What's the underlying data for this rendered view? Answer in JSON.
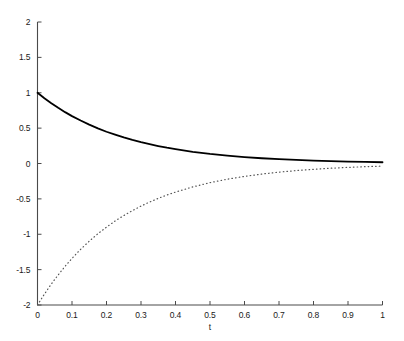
{
  "chart_data": {
    "type": "line",
    "title": "",
    "xlabel": "t",
    "ylabel": "",
    "xlim": [
      0,
      1
    ],
    "ylim": [
      -2,
      2
    ],
    "grid": false,
    "legend": "none",
    "xticks": [
      "0",
      "0.1",
      "0.2",
      "0.3",
      "0.4",
      "0.5",
      "0.6",
      "0.7",
      "0.8",
      "0.9",
      "1"
    ],
    "xtick_values": [
      0,
      0.1,
      0.2,
      0.3,
      0.4,
      0.5,
      0.6,
      0.7,
      0.8,
      0.9,
      1
    ],
    "yticks": [
      "2",
      "1.5",
      "1",
      "0.5",
      "0",
      "-0.5",
      "-1",
      "-1.5",
      "-2"
    ],
    "ytick_values": [
      2,
      1.5,
      1,
      0.5,
      0,
      -0.5,
      -1,
      -1.5,
      -2
    ],
    "series": [
      {
        "name": "solid-curve",
        "style": "solid",
        "color": "#000000",
        "width": 1.8,
        "x": [
          0,
          0.02,
          0.04,
          0.06,
          0.08,
          0.1,
          0.125,
          0.15,
          0.175,
          0.2,
          0.225,
          0.25,
          0.275,
          0.3,
          0.325,
          0.35,
          0.375,
          0.4,
          0.45,
          0.5,
          0.55,
          0.6,
          0.65,
          0.7,
          0.75,
          0.8,
          0.85,
          0.9,
          0.95,
          1
        ],
        "values": [
          1.0,
          0.923,
          0.852,
          0.787,
          0.726,
          0.67,
          0.607,
          0.549,
          0.497,
          0.449,
          0.407,
          0.368,
          0.333,
          0.301,
          0.273,
          0.247,
          0.223,
          0.202,
          0.165,
          0.135,
          0.111,
          0.091,
          0.074,
          0.061,
          0.05,
          0.041,
          0.033,
          0.027,
          0.022,
          0.018
        ]
      },
      {
        "name": "dotted-curve",
        "style": "dotted",
        "color": "#555555",
        "width": 1.2,
        "x": [
          0,
          0.02,
          0.04,
          0.06,
          0.08,
          0.1,
          0.125,
          0.15,
          0.175,
          0.2,
          0.225,
          0.25,
          0.275,
          0.3,
          0.325,
          0.35,
          0.375,
          0.4,
          0.45,
          0.5,
          0.55,
          0.6,
          0.65,
          0.7,
          0.75,
          0.8,
          0.85,
          0.9,
          0.95,
          1
        ],
        "values": [
          -2.0,
          -1.846,
          -1.705,
          -1.574,
          -1.453,
          -1.341,
          -1.213,
          -1.098,
          -0.993,
          -0.899,
          -0.813,
          -0.736,
          -0.666,
          -0.602,
          -0.545,
          -0.493,
          -0.446,
          -0.404,
          -0.331,
          -0.271,
          -0.222,
          -0.182,
          -0.149,
          -0.122,
          -0.1,
          -0.082,
          -0.067,
          -0.055,
          -0.045,
          -0.037
        ]
      }
    ]
  },
  "axes": {
    "x_title": "t"
  }
}
